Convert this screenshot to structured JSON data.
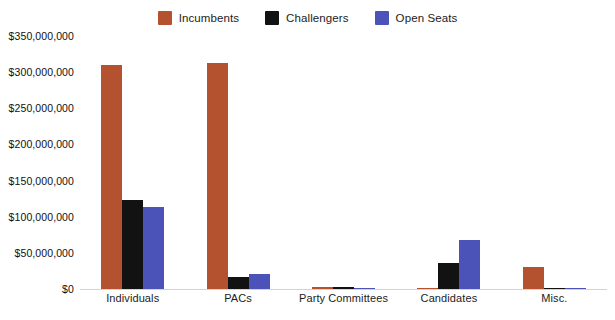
{
  "chart_data": {
    "type": "bar",
    "title": "",
    "xlabel": "",
    "ylabel": "",
    "categories": [
      "Individuals",
      "PACs",
      "Party Committees",
      "Candidates",
      "Misc."
    ],
    "series": [
      {
        "name": "Incumbents",
        "color": "#b4512f",
        "values": [
          310000000,
          312000000,
          2500000,
          2000000,
          30000000
        ]
      },
      {
        "name": "Challengers",
        "color": "#121212",
        "values": [
          123000000,
          17000000,
          2500000,
          36000000,
          1200000
        ]
      },
      {
        "name": "Open Seats",
        "color": "#4b52b8",
        "values": [
          114000000,
          21000000,
          2000000,
          68000000,
          1200000
        ]
      }
    ],
    "ylim": [
      0,
      350000000
    ],
    "ytick_values": [
      0,
      50000000,
      100000000,
      150000000,
      200000000,
      250000000,
      300000000,
      350000000
    ],
    "ytick_labels": [
      "$0",
      "$50,000,000",
      "$100,000,000",
      "$150,000,000",
      "$200,000,000",
      "$250,000,000",
      "$300,000,000",
      "$350,000,000"
    ],
    "grid": false,
    "legend_position": "top-center"
  },
  "legend": {
    "items": [
      {
        "label": "Incumbents",
        "color": "#b4512f",
        "icon": "square-swatch-icon"
      },
      {
        "label": "Challengers",
        "color": "#121212",
        "icon": "square-swatch-icon"
      },
      {
        "label": "Open Seats",
        "color": "#4b52b8",
        "icon": "square-swatch-icon"
      }
    ]
  },
  "colors": {
    "incumbents": "#b4512f",
    "challengers": "#121212",
    "open_seats": "#4b52b8",
    "axis_line": "#c9d6df",
    "background": "#ffffff",
    "text": "#1c1c1c"
  }
}
